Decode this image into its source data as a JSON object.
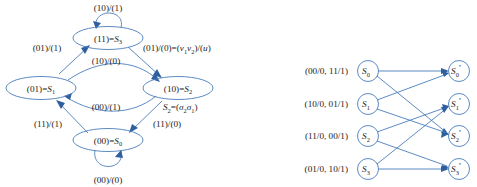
{
  "figure": {
    "background_color": "#ffffff",
    "line_color": "#4a7ebb",
    "arrow_color": "#2f5f9e",
    "text_color": "#1a1a1a"
  },
  "state_diagram": {
    "nodes": [
      {
        "id": "S3",
        "binary": "(11)",
        "eq": "=",
        "name": "S",
        "sub": "3",
        "cx": 108,
        "cy": 38
      },
      {
        "id": "S1",
        "binary": "(01)",
        "eq": "=",
        "name": "S",
        "sub": "1",
        "cx": 41,
        "cy": 88
      },
      {
        "id": "S2",
        "binary": "(10)",
        "eq": "=",
        "name": "S",
        "sub": "2",
        "cx": 178,
        "cy": 88
      },
      {
        "id": "S0",
        "binary": "(00)",
        "eq": "=",
        "name": "S",
        "sub": "0",
        "cx": 108,
        "cy": 140
      }
    ],
    "edge_labels": {
      "self_loop_top": "(10)/(1)",
      "self_loop_bottom": "(00)/(0)",
      "s1_to_s3": "(01)/(1)",
      "s3_to_s2_prefix": "(01)/(0)=(",
      "s3_to_s2_v1": "v",
      "s3_to_s2_v1sub": "1",
      "s3_to_s2_v2": "v",
      "s3_to_s2_v2sub": "2",
      "s3_to_s2_suffix": ")/(",
      "s3_to_s2_u": "u",
      "s3_to_s2_close": ")",
      "s1_to_s2_upper": "(10)/(0)",
      "s2_to_s1_lower": "(00)/(1)",
      "s0_to_s1": "(11)/(1)",
      "s2_to_s0": "(11)/(0)"
    },
    "annotation": {
      "name": "S",
      "sub": "2",
      "eq": "=(",
      "sigma2": "σ",
      "sigma2_sub": "2",
      "sigma1": "σ",
      "sigma1_sub": "1",
      "close": ")"
    }
  },
  "trellis": {
    "input_labels": [
      "(00/0, 11/1)",
      "(10/0, 01/1)",
      "(11/0, 00/1)",
      "(01/0, 10/1)"
    ],
    "left_nodes": [
      {
        "name": "S",
        "sub": "0",
        "cx": 368,
        "cy": 71
      },
      {
        "name": "S",
        "sub": "1",
        "cx": 368,
        "cy": 104
      },
      {
        "name": "S",
        "sub": "2",
        "cx": 368,
        "cy": 136
      },
      {
        "name": "S",
        "sub": "3",
        "cx": 368,
        "cy": 169
      }
    ],
    "right_nodes": [
      {
        "name": "S",
        "sub": "0",
        "prime": "′",
        "cx": 459,
        "cy": 71
      },
      {
        "name": "S",
        "sub": "1",
        "prime": "′",
        "cx": 459,
        "cy": 104
      },
      {
        "name": "S",
        "sub": "2",
        "prime": "′",
        "cx": 459,
        "cy": 136
      },
      {
        "name": "S",
        "sub": "3",
        "prime": "′",
        "cx": 459,
        "cy": 169
      }
    ],
    "connections": [
      {
        "from": 0,
        "to": 0
      },
      {
        "from": 0,
        "to": 2
      },
      {
        "from": 1,
        "to": 0
      },
      {
        "from": 1,
        "to": 2
      },
      {
        "from": 2,
        "to": 1
      },
      {
        "from": 2,
        "to": 3
      },
      {
        "from": 3,
        "to": 1
      },
      {
        "from": 3,
        "to": 3
      }
    ]
  }
}
